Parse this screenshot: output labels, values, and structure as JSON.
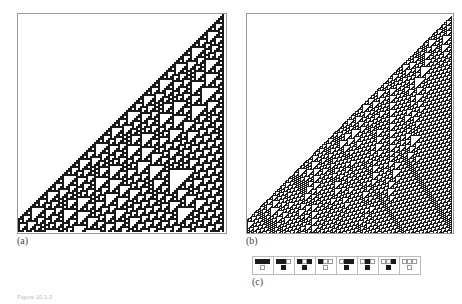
{
  "figure": {
    "panels": [
      {
        "id": "a",
        "label": "(a)",
        "description": "Rule 110 cellular automaton evolution from single black cell",
        "style": "black-white"
      },
      {
        "id": "b",
        "label": "(b)",
        "description": "Rule 110 evolution from random initial conditions, showing localized structures",
        "style": "dark-textured"
      }
    ],
    "rules_label": "(c)",
    "rule_number": 110,
    "rule_cases": [
      {
        "pattern": [
          1,
          1,
          1
        ],
        "output": 0
      },
      {
        "pattern": [
          1,
          1,
          0
        ],
        "output": 1
      },
      {
        "pattern": [
          1,
          0,
          1
        ],
        "output": 1
      },
      {
        "pattern": [
          1,
          0,
          0
        ],
        "output": 0
      },
      {
        "pattern": [
          0,
          1,
          1
        ],
        "output": 1
      },
      {
        "pattern": [
          0,
          1,
          0
        ],
        "output": 1
      },
      {
        "pattern": [
          0,
          0,
          1
        ],
        "output": 1
      },
      {
        "pattern": [
          0,
          0,
          0
        ],
        "output": 0
      }
    ],
    "caption": "Figure 10.1.3"
  },
  "colors": {
    "on": "#1a1a1a",
    "off": "#ffffff",
    "border": "#9a9a9a",
    "dark_bg": "#3c3c3c"
  }
}
